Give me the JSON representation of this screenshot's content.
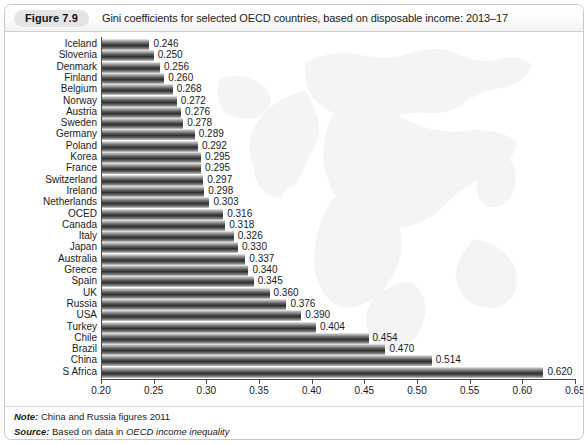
{
  "figure": {
    "badge": "Figure 7.9",
    "caption": "Gini coefficients for selected OECD countries, based on disposable income: 2013–17"
  },
  "notes": {
    "note_key": "Note:",
    "note_text": " China and Russia figures 2011",
    "source_key": "Source:",
    "source_text_pre": " Based on data in ",
    "source_text_ital": "OECD income inequality"
  },
  "chart_data": {
    "type": "bar",
    "orientation": "horizontal",
    "title": "Gini coefficients for selected OECD countries, based on disposable income: 2013–17",
    "xlabel": "",
    "ylabel": "",
    "xlim": [
      0.2,
      0.65
    ],
    "grid": false,
    "legend": null,
    "xticks": [
      "0.20",
      "0.25",
      "0.30",
      "0.35",
      "0.40",
      "0.45",
      "0.50",
      "0.55",
      "0.60",
      "0.65"
    ],
    "xtick_values": [
      0.2,
      0.25,
      0.3,
      0.35,
      0.4,
      0.45,
      0.5,
      0.55,
      0.6,
      0.65
    ],
    "categories": [
      "Iceland",
      "Slovenia",
      "Denmark",
      "Finland",
      "Belgium",
      "Norway",
      "Austria",
      "Sweden",
      "Germany",
      "Poland",
      "Korea",
      "France",
      "Switzerland",
      "Ireland",
      "Netherlands",
      "OCED",
      "Canada",
      "Italy",
      "Japan",
      "Australia",
      "Greece",
      "Spain",
      "UK",
      "Russia",
      "USA",
      "Turkey",
      "Chile",
      "Brazil",
      "China",
      "S Africa"
    ],
    "values": [
      0.246,
      0.25,
      0.256,
      0.26,
      0.268,
      0.272,
      0.276,
      0.278,
      0.289,
      0.292,
      0.295,
      0.295,
      0.297,
      0.298,
      0.303,
      0.316,
      0.318,
      0.326,
      0.33,
      0.337,
      0.34,
      0.345,
      0.36,
      0.376,
      0.39,
      0.404,
      0.454,
      0.47,
      0.514,
      0.62
    ],
    "value_labels": [
      "0.246",
      "0.250",
      "0.256",
      "0.260",
      "0.268",
      "0.272",
      "0.276",
      "0.278",
      "0.289",
      "0.292",
      "0.295",
      "0.295",
      "0.297",
      "0.298",
      "0.303",
      "0.316",
      "0.318",
      "0.326",
      "0.330",
      "0.337",
      "0.340",
      "0.345",
      "0.360",
      "0.376",
      "0.390",
      "0.404",
      "0.454",
      "0.470",
      "0.514",
      "0.620"
    ]
  }
}
